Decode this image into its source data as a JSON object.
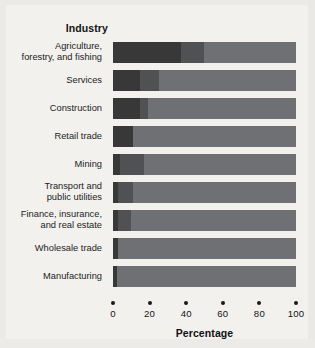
{
  "chart_data": {
    "type": "bar",
    "subtype": "stacked-horizontal-100",
    "title": "",
    "column_header": "Industry",
    "xlabel": "Percentage",
    "ylabel": "Industry",
    "xlim": [
      0,
      100
    ],
    "xticks": [
      0,
      20,
      40,
      60,
      80,
      100
    ],
    "xticklabels": [
      "0",
      "20",
      "40",
      "60",
      "80",
      "100"
    ],
    "grid": false,
    "legend": "none",
    "categories": [
      "Agriculture, forestry, and fishing",
      "Services",
      "Construction",
      "Retail trade",
      "Mining",
      "Transport and public utilities",
      "Finance, insurance, and real estate",
      "Wholesale trade",
      "Manufacturing"
    ],
    "series": [
      {
        "name": "segment-1",
        "color": "#383838",
        "values": [
          37,
          15,
          15,
          11,
          4,
          3,
          3,
          3,
          2
        ]
      },
      {
        "name": "segment-2",
        "color": "#505153",
        "values": [
          13,
          10,
          4,
          0,
          13,
          8,
          7,
          0,
          0
        ]
      },
      {
        "name": "segment-3",
        "color": "#6e7073",
        "values": [
          50,
          75,
          81,
          89,
          83,
          89,
          90,
          97,
          98
        ]
      }
    ]
  },
  "rows": [
    {
      "label_lines": [
        "Agriculture,",
        "forestry, and fishing"
      ],
      "values": [
        37,
        13,
        50
      ]
    },
    {
      "label_lines": [
        "Services"
      ],
      "values": [
        15,
        10,
        75
      ]
    },
    {
      "label_lines": [
        "Construction"
      ],
      "values": [
        15,
        4,
        81
      ]
    },
    {
      "label_lines": [
        "Retail trade"
      ],
      "values": [
        11,
        0,
        89
      ]
    },
    {
      "label_lines": [
        "Mining"
      ],
      "values": [
        4,
        13,
        83
      ]
    },
    {
      "label_lines": [
        "Transport and",
        "public utilities"
      ],
      "values": [
        3,
        8,
        89
      ]
    },
    {
      "label_lines": [
        "Finance, insurance,",
        "and real estate"
      ],
      "values": [
        3,
        7,
        90
      ]
    },
    {
      "label_lines": [
        "Wholesale trade"
      ],
      "values": [
        3,
        0,
        97
      ]
    },
    {
      "label_lines": [
        "Manufacturing"
      ],
      "values": [
        2,
        0,
        98
      ]
    }
  ],
  "colors": {
    "segment_1": "#383838",
    "segment_2": "#505153",
    "segment_3": "#6e7073",
    "background": "#f2f1ee",
    "text": "#1a1a1a"
  },
  "axis": {
    "title": "Percentage",
    "ticks": [
      "0",
      "20",
      "40",
      "60",
      "80",
      "100"
    ]
  },
  "header": {
    "column_title": "Industry"
  }
}
